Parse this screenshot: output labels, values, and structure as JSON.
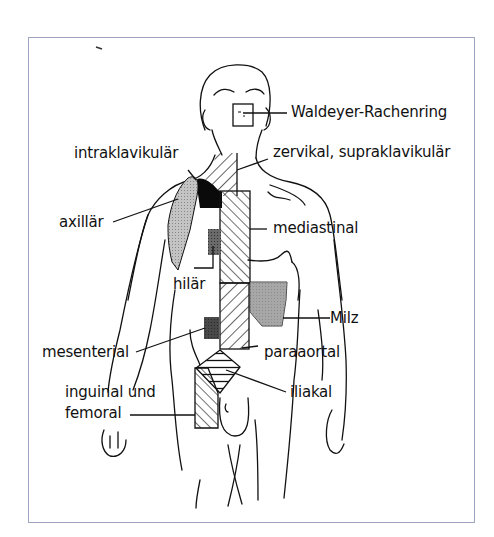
{
  "figure": {
    "labels": {
      "waldeyer": "Waldeyer-Rachenring",
      "zervikal": "zervikal, supraklavikulär",
      "intraklavikular": "intraklavikulär",
      "axillar": "axillär",
      "mediastinal": "mediastinal",
      "hilar": "hilär",
      "milz": "Milz",
      "mesenterial": "mesenterial",
      "paraaortal": "paraaortal",
      "inguinal_line1": "inguinal und",
      "inguinal_line2": "femoral",
      "iliakal": "iliakal"
    },
    "colors": {
      "frame": "#9ea4c0",
      "ink": "#111111",
      "grey_fill": "#b8b8b8",
      "dark_grey_fill": "#6a6a6a",
      "black_fill": "#0a0a0a",
      "milz_fill": "#8f8f8f"
    }
  }
}
